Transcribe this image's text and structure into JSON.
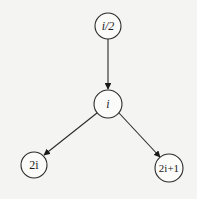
{
  "diagram": {
    "type": "binary-heap-index-relations",
    "nodes": [
      {
        "id": "parent",
        "label": "i/2",
        "cx": 108,
        "cy": 26,
        "r": 13
      },
      {
        "id": "current",
        "label": "i",
        "cx": 108,
        "cy": 104,
        "r": 14
      },
      {
        "id": "left-child",
        "label": "2i",
        "cx": 34,
        "cy": 165,
        "r": 13
      },
      {
        "id": "right-child",
        "label": "2i+1",
        "cx": 169,
        "cy": 168,
        "r": 14
      }
    ],
    "edges": [
      {
        "from": "parent",
        "to": "current"
      },
      {
        "from": "current",
        "to": "left-child"
      },
      {
        "from": "current",
        "to": "right-child"
      }
    ],
    "colors": {
      "background": "#f4f4f2",
      "stroke": "#2a2a2a",
      "text": "#1a1a1a"
    }
  }
}
